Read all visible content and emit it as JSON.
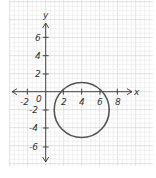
{
  "chart_data": {
    "type": "line",
    "title": "",
    "xlabel": "x",
    "ylabel": "y",
    "xlim": [
      -2,
      8
    ],
    "ylim": [
      -6,
      6
    ],
    "grid": true,
    "x_ticks": [
      "-2",
      "2",
      "4",
      "6",
      "8"
    ],
    "y_ticks": [
      "6",
      "4",
      "2",
      "-2",
      "-4",
      "-6"
    ],
    "origin_label": "0",
    "shapes": [
      {
        "type": "circle",
        "center": [
          4,
          -2
        ],
        "radius": 3
      }
    ],
    "colors": {
      "curve": "#555555",
      "grid_minor": "#e6e6e6",
      "grid_major": "#cfcfcf",
      "axis": "#444444"
    }
  },
  "labels": {
    "x_axis": "x",
    "y_axis": "y",
    "origin": "0",
    "xt": [
      "-2",
      "2",
      "4",
      "6",
      "8"
    ],
    "yt": [
      "6",
      "4",
      "2",
      "-2",
      "-4",
      "-6"
    ]
  }
}
